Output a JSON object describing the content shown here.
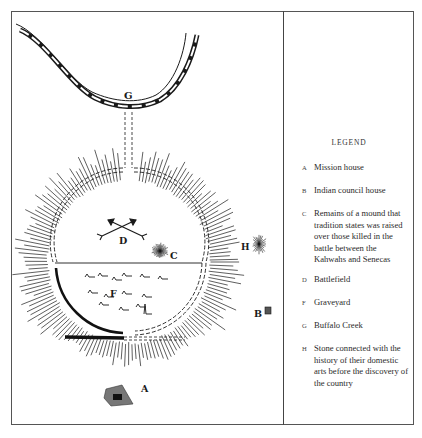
{
  "figure": {
    "type": "historical site map",
    "map_labels": {
      "A": "A",
      "B": "B",
      "C": "C",
      "D": "D",
      "F": "F",
      "G": "G",
      "H": "H"
    }
  },
  "legend": {
    "title": "LEGEND",
    "items": [
      {
        "letter": "A",
        "description": "Mission house"
      },
      {
        "letter": "B",
        "description": "Indian council house"
      },
      {
        "letter": "C",
        "description": "Remains of a mound that tradition states was raised over those killed in the battle between the Kahwahs and Senecas"
      },
      {
        "letter": "D",
        "description": "Battlefield"
      },
      {
        "letter": "F",
        "description": "Graveyard"
      },
      {
        "letter": "G",
        "description": "Buffalo Creek"
      },
      {
        "letter": "H",
        "description": "Stone connected with the history of their domestic arts before the discovery of the country"
      }
    ]
  },
  "colors": {
    "ink": "#1a1a1a",
    "frame": "#555555",
    "background": "#ffffff"
  }
}
